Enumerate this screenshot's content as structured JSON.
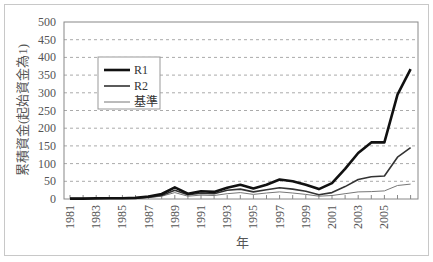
{
  "chart_data": {
    "type": "line",
    "title": "",
    "xlabel": "年",
    "ylabel": "累積資金(起始資金為1)",
    "ylim": [
      0,
      500
    ],
    "yticks": [
      0,
      50,
      100,
      150,
      200,
      250,
      300,
      350,
      400,
      450,
      500
    ],
    "x": [
      1981,
      1982,
      1983,
      1984,
      1985,
      1986,
      1987,
      1988,
      1989,
      1990,
      1991,
      1992,
      1993,
      1994,
      1995,
      1996,
      1997,
      1998,
      1999,
      2000,
      2001,
      2002,
      2003,
      2004,
      2005,
      2006,
      2007
    ],
    "xtick_labels": [
      "1981",
      "1983",
      "1985",
      "1987",
      "1989",
      "1991",
      "1993",
      "1995",
      "1997",
      "1999",
      "2001",
      "2003",
      "2005"
    ],
    "grid": true,
    "legend_position": "upper left",
    "series": [
      {
        "name": "R1",
        "color": "#111111",
        "width": 2.6,
        "values": [
          1,
          1,
          2,
          2,
          2,
          3,
          7,
          14,
          33,
          15,
          22,
          20,
          32,
          40,
          30,
          40,
          55,
          50,
          40,
          28,
          45,
          85,
          130,
          160,
          160,
          295,
          367
        ]
      },
      {
        "name": "R2",
        "color": "#333333",
        "width": 1.6,
        "values": [
          1,
          1,
          1,
          2,
          2,
          2,
          5,
          10,
          25,
          12,
          16,
          15,
          25,
          28,
          20,
          26,
          32,
          28,
          22,
          12,
          18,
          35,
          55,
          63,
          65,
          118,
          145
        ]
      },
      {
        "name": "基準",
        "color": "#777777",
        "width": 1.0,
        "values": [
          1,
          1,
          1,
          1,
          1,
          2,
          4,
          8,
          18,
          8,
          11,
          10,
          15,
          18,
          13,
          17,
          20,
          17,
          13,
          8,
          10,
          15,
          20,
          21,
          23,
          38,
          42
        ]
      }
    ]
  }
}
